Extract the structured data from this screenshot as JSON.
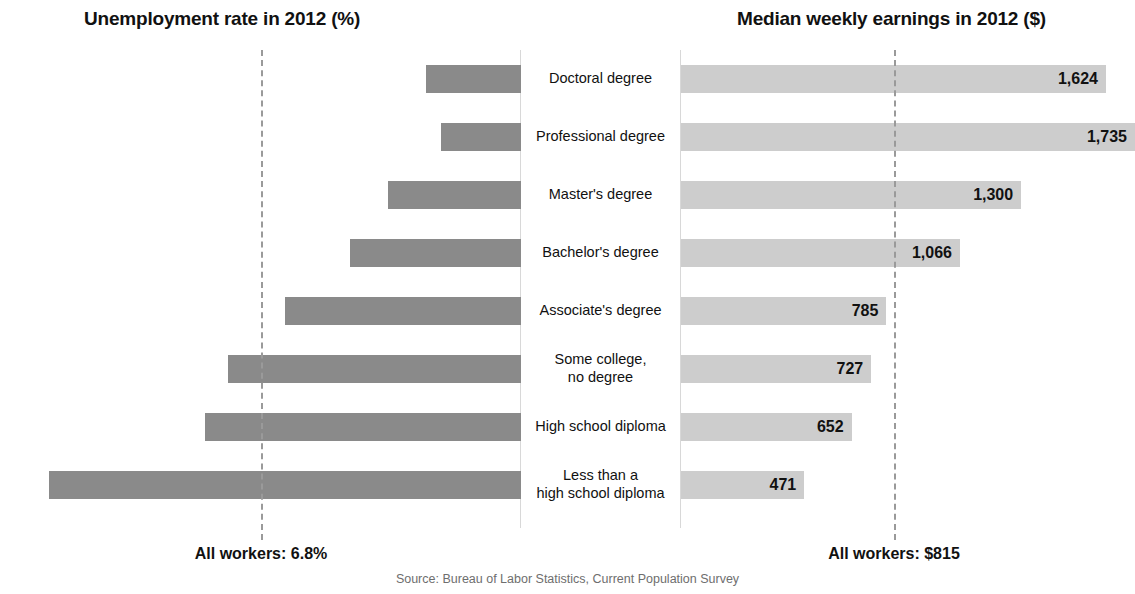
{
  "left_panel": {
    "title": "Unemployment rate in 2012 (%)"
  },
  "right_panel": {
    "title": "Median weekly earnings in 2012 ($)"
  },
  "footer": {
    "all_workers_unemployment": "All workers: 6.8%",
    "all_workers_earnings": "All workers: $815",
    "source": "Source: Bureau of Labor Statistics, Current Population Survey"
  },
  "colors": {
    "unemployment_bar": "#8a8a8a",
    "earnings_bar": "#cdcdcd",
    "reference_line": "#9a9a9a",
    "axis_line": "#d8d8d8",
    "text": "#111111",
    "source_text": "#6e6e6e"
  },
  "chart_data": {
    "type": "bar",
    "orientation": "horizontal",
    "layout": "paired diverging bars with centered category labels",
    "grid": false,
    "legend": "none",
    "categories": [
      "Doctoral degree",
      "Professional degree",
      "Master's degree",
      "Bachelor's degree",
      "Associate's degree",
      "Some college,\nno degree",
      "High school diploma",
      "Less than a\nhigh school diploma"
    ],
    "series": [
      {
        "name": "Unemployment rate in 2012 (%)",
        "unit": "%",
        "direction": "left",
        "axis_max": 12.4,
        "values": [
          2.5,
          2.1,
          3.5,
          4.5,
          6.2,
          7.7,
          8.3,
          12.4
        ],
        "labels": [
          "2.5",
          "2.1",
          "3.5",
          "4.5",
          "6.2",
          "7.7",
          "8.3",
          "12.4"
        ],
        "reference_value": 6.8,
        "reference_label": "All workers: 6.8%"
      },
      {
        "name": "Median weekly earnings in 2012 ($)",
        "unit": "$",
        "direction": "right",
        "axis_max": 1735,
        "values": [
          1624,
          1735,
          1300,
          1066,
          785,
          727,
          652,
          471
        ],
        "labels": [
          "1,624",
          "1,735",
          "1,300",
          "1,066",
          "785",
          "727",
          "652",
          "471"
        ],
        "reference_value": 815,
        "reference_label": "All workers: $815"
      }
    ],
    "source": "Source: Bureau of Labor Statistics, Current Population Survey"
  }
}
